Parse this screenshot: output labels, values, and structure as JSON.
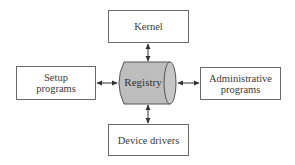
{
  "diagram": {
    "center": {
      "label": "Registry",
      "shape": "cylinder",
      "fill": "#bdbdbd",
      "stroke": "#555555"
    },
    "nodes": {
      "kernel": {
        "lines": [
          "Kernel"
        ],
        "position": "top"
      },
      "setup": {
        "lines": [
          "Setup",
          "programs"
        ],
        "position": "left"
      },
      "admin": {
        "lines": [
          "Administrative",
          "programs"
        ],
        "position": "right"
      },
      "device": {
        "lines": [
          "Device drivers"
        ],
        "position": "bottom"
      }
    },
    "edges": [
      {
        "from": "kernel",
        "to": "Registry",
        "type": "bidirectional"
      },
      {
        "from": "setup",
        "to": "Registry",
        "type": "bidirectional"
      },
      {
        "from": "admin",
        "to": "Registry",
        "type": "bidirectional"
      },
      {
        "from": "device",
        "to": "Registry",
        "type": "bidirectional"
      }
    ],
    "colors": {
      "box_border": "#6a6a6a",
      "text": "#3a3a3a",
      "arrow": "#333333"
    }
  }
}
